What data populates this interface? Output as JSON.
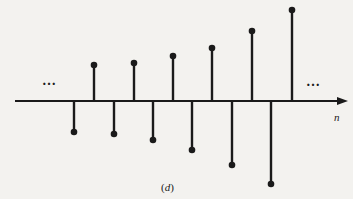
{
  "figure": {
    "caption_open": "(",
    "caption_letter": "d",
    "caption_close": ")",
    "axis_label": "n",
    "left_ellipsis": "…",
    "right_ellipsis": "…",
    "colors": {
      "background": "#f3f2ef",
      "ink": "#1a1a1a"
    }
  },
  "chart_data": {
    "type": "stem",
    "title": "(d)",
    "xlabel": "n",
    "ylabel": "",
    "x": [
      1,
      2,
      3,
      4,
      5,
      6,
      7,
      8,
      9,
      10,
      11,
      12
    ],
    "values": [
      -3.1,
      3.6,
      -3.3,
      3.8,
      -3.9,
      4.5,
      -4.9,
      5.3,
      -6.4,
      7.0,
      -8.3,
      9.1
    ],
    "units_note": "relative amplitudes read from pixel heights (1 unit ≈ 10 px)",
    "grid": false,
    "legend": null,
    "annotations": [
      "… (left, continues)",
      "… (right, continues)"
    ]
  },
  "layout": {
    "axis_y": 101,
    "axis_x_start": 15,
    "axis_x_end": 348,
    "stem_x": [
      74,
      94,
      114,
      134,
      153,
      173,
      192,
      212,
      232,
      252,
      271,
      292
    ],
    "stem_tip_y": [
      132,
      65,
      134,
      63,
      140,
      56,
      150,
      48,
      165,
      31,
      184,
      10
    ]
  }
}
